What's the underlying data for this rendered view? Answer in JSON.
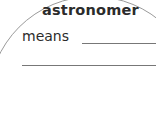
{
  "worksheet": {
    "term": "astronomer",
    "prompt": "means",
    "answer_line_1": "",
    "answer_line_2": ""
  }
}
